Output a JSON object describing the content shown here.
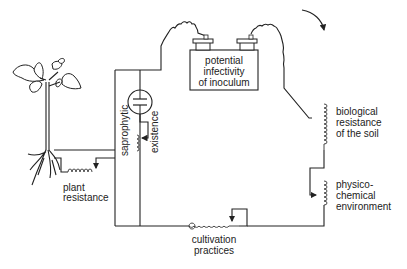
{
  "diagram": {
    "colors": {
      "line": "#222222",
      "background": "#ffffff"
    },
    "battery": {
      "label_lines": [
        "potential",
        "infectivity",
        "of inoculum"
      ]
    },
    "components": {
      "plant_resistance": {
        "lines": [
          "plant",
          "resistance"
        ]
      },
      "saprophytic_existence": {
        "word1": "saprophytic",
        "word2": "existence"
      },
      "biological_resistance": {
        "lines": [
          "biological",
          "resistance",
          "of the soil"
        ]
      },
      "physico_chemical": {
        "lines": [
          "physico-",
          "chemical",
          "environment"
        ]
      },
      "cultivation_practices": {
        "lines": [
          "cultivation",
          "practices"
        ]
      }
    },
    "icons": {
      "plant": "plant-icon",
      "capacitor": "capacitor-icon",
      "battery": "battery-icon",
      "flow_arrow": "curved-arrow-icon"
    }
  }
}
